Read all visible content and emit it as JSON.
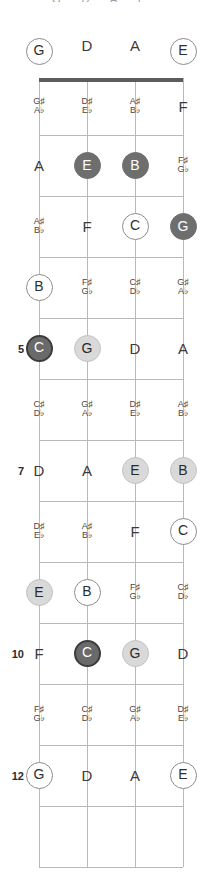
{
  "caption": "G D A E",
  "instrument": {
    "name": "bass-guitar",
    "string_count": 4,
    "fret_count": 12,
    "tuning_display": [
      "G",
      "D",
      "A",
      "E"
    ]
  },
  "colors": {
    "root_fill": "#6a6a6a",
    "root_ring": "#3c3c3c",
    "dark_fill": "#6e6e6e",
    "light_fill": "#d9d9d9",
    "outline_stroke": "#8c8c90",
    "line": "#b9b9bd",
    "nut": "#5c5c5c",
    "text": "#3b3b3b"
  },
  "fret_numbers": [
    {
      "fret": 5,
      "label": "5"
    },
    {
      "fret": 7,
      "label": "7"
    },
    {
      "fret": 10,
      "label": "10"
    },
    {
      "fret": 12,
      "label": "12"
    }
  ],
  "open_strings": [
    {
      "string": 1,
      "label": "G",
      "style": "open"
    },
    {
      "string": 2,
      "label": "D",
      "style": "plain"
    },
    {
      "string": 3,
      "label": "A",
      "style": "plain"
    },
    {
      "string": 4,
      "label": "E",
      "style": "open"
    }
  ],
  "frets": [
    {
      "fret": 1,
      "notes": [
        {
          "string": 1,
          "label": "G♯/A♭",
          "lines": [
            "G♯",
            "A♭"
          ],
          "style": "accidental"
        },
        {
          "string": 2,
          "label": "D♯/E♭",
          "lines": [
            "D♯",
            "E♭"
          ],
          "style": "accidental"
        },
        {
          "string": 3,
          "label": "A♯/B♭",
          "lines": [
            "A♯",
            "B♭"
          ],
          "style": "accidental"
        },
        {
          "string": 4,
          "label": "F",
          "style": "plain"
        }
      ]
    },
    {
      "fret": 2,
      "notes": [
        {
          "string": 1,
          "label": "A",
          "style": "plain"
        },
        {
          "string": 2,
          "label": "E",
          "style": "dark"
        },
        {
          "string": 3,
          "label": "B",
          "style": "dark"
        },
        {
          "string": 4,
          "label": "F♯/G♭",
          "lines": [
            "F♯",
            "G♭"
          ],
          "style": "accidental"
        }
      ]
    },
    {
      "fret": 3,
      "notes": [
        {
          "string": 1,
          "label": "A♯/B♭",
          "lines": [
            "A♯",
            "B♭"
          ],
          "style": "accidental"
        },
        {
          "string": 2,
          "label": "F",
          "style": "plain"
        },
        {
          "string": 3,
          "label": "C",
          "style": "outline"
        },
        {
          "string": 4,
          "label": "G",
          "style": "dark"
        }
      ]
    },
    {
      "fret": 4,
      "notes": [
        {
          "string": 1,
          "label": "B",
          "style": "outline"
        },
        {
          "string": 2,
          "label": "F♯/G♭",
          "lines": [
            "F♯",
            "G♭"
          ],
          "style": "accidental"
        },
        {
          "string": 3,
          "label": "C♯/D♭",
          "lines": [
            "C♯",
            "D♭"
          ],
          "style": "accidental"
        },
        {
          "string": 4,
          "label": "G♯/A♭",
          "lines": [
            "G♯",
            "A♭"
          ],
          "style": "accidental"
        }
      ]
    },
    {
      "fret": 5,
      "notes": [
        {
          "string": 1,
          "label": "C",
          "style": "root"
        },
        {
          "string": 2,
          "label": "G",
          "style": "light"
        },
        {
          "string": 3,
          "label": "D",
          "style": "plain"
        },
        {
          "string": 4,
          "label": "A",
          "style": "plain"
        }
      ]
    },
    {
      "fret": 6,
      "notes": [
        {
          "string": 1,
          "label": "C♯/D♭",
          "lines": [
            "C♯",
            "D♭"
          ],
          "style": "accidental"
        },
        {
          "string": 2,
          "label": "G♯/A♭",
          "lines": [
            "G♯",
            "A♭"
          ],
          "style": "accidental"
        },
        {
          "string": 3,
          "label": "D♯/E♭",
          "lines": [
            "D♯",
            "E♭"
          ],
          "style": "accidental"
        },
        {
          "string": 4,
          "label": "A♯/B♭",
          "lines": [
            "A♯",
            "B♭"
          ],
          "style": "accidental"
        }
      ]
    },
    {
      "fret": 7,
      "notes": [
        {
          "string": 1,
          "label": "D",
          "style": "plain"
        },
        {
          "string": 2,
          "label": "A",
          "style": "plain"
        },
        {
          "string": 3,
          "label": "E",
          "style": "light"
        },
        {
          "string": 4,
          "label": "B",
          "style": "light"
        }
      ]
    },
    {
      "fret": 8,
      "notes": [
        {
          "string": 1,
          "label": "D♯/E♭",
          "lines": [
            "D♯",
            "E♭"
          ],
          "style": "accidental"
        },
        {
          "string": 2,
          "label": "A♯/B♭",
          "lines": [
            "A♯",
            "B♭"
          ],
          "style": "accidental"
        },
        {
          "string": 3,
          "label": "F",
          "style": "plain"
        },
        {
          "string": 4,
          "label": "C",
          "style": "outline"
        }
      ]
    },
    {
      "fret": 9,
      "notes": [
        {
          "string": 1,
          "label": "E",
          "style": "light"
        },
        {
          "string": 2,
          "label": "B",
          "style": "outline"
        },
        {
          "string": 3,
          "label": "F♯/G♭",
          "lines": [
            "F♯",
            "G♭"
          ],
          "style": "accidental"
        },
        {
          "string": 4,
          "label": "C♯/D♭",
          "lines": [
            "C♯",
            "D♭"
          ],
          "style": "accidental"
        }
      ]
    },
    {
      "fret": 10,
      "notes": [
        {
          "string": 1,
          "label": "F",
          "style": "plain"
        },
        {
          "string": 2,
          "label": "C",
          "style": "root"
        },
        {
          "string": 3,
          "label": "G",
          "style": "light"
        },
        {
          "string": 4,
          "label": "D",
          "style": "plain"
        }
      ]
    },
    {
      "fret": 11,
      "notes": [
        {
          "string": 1,
          "label": "F♯/G♭",
          "lines": [
            "F♯",
            "G♭"
          ],
          "style": "accidental"
        },
        {
          "string": 2,
          "label": "C♯/D♭",
          "lines": [
            "C♯",
            "D♭"
          ],
          "style": "accidental"
        },
        {
          "string": 3,
          "label": "G♯/A♭",
          "lines": [
            "G♯",
            "A♭"
          ],
          "style": "accidental"
        },
        {
          "string": 4,
          "label": "D♯/E♭",
          "lines": [
            "D♯",
            "E♭"
          ],
          "style": "accidental"
        }
      ]
    },
    {
      "fret": 12,
      "notes": [
        {
          "string": 1,
          "label": "G",
          "style": "open"
        },
        {
          "string": 2,
          "label": "D",
          "style": "plain"
        },
        {
          "string": 3,
          "label": "A",
          "style": "plain"
        },
        {
          "string": 4,
          "label": "E",
          "style": "open"
        }
      ]
    }
  ],
  "geometry": {
    "string_x": [
      39,
      87,
      135,
      183
    ],
    "nut_y": 78,
    "fret_y": [
      135,
      196,
      257,
      318,
      379,
      440,
      501,
      562,
      623,
      684,
      745,
      806,
      867
    ],
    "open_label_y": 52
  }
}
